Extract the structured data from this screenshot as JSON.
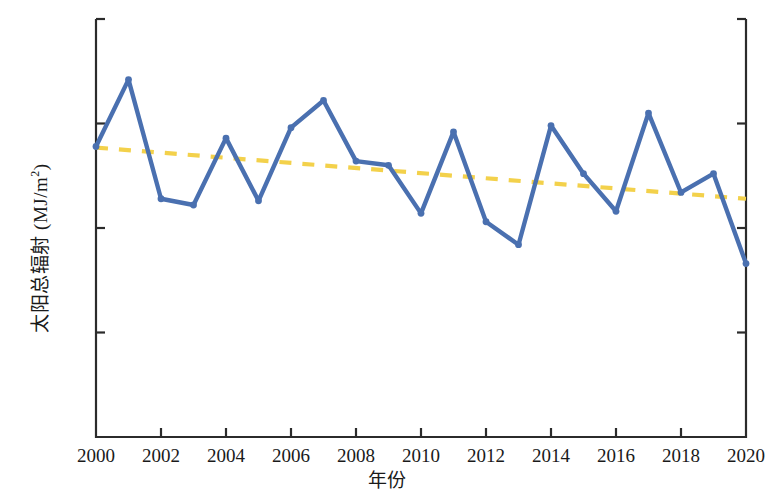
{
  "chart_data": {
    "type": "line",
    "title": "",
    "xlabel": "年份",
    "ylabel": "太阳总辐射 (MJ/m2)",
    "ylabel_main": "太阳总辐射 (MJ/m",
    "ylabel_sup": "2",
    "ylabel_tail": ")",
    "xlim": [
      2000,
      2020
    ],
    "ylim": [
      13.0,
      15.0
    ],
    "grid": false,
    "legend": "none",
    "ytick_labels": [
      "15.00",
      "14.50",
      "14.00",
      "13.50",
      "13.00"
    ],
    "ytick_values": [
      15.0,
      14.5,
      14.0,
      13.5,
      13.0
    ],
    "ytick_step": 0.5,
    "xtick_labels": [
      "2000",
      "2002",
      "2004",
      "2006",
      "2008",
      "2010",
      "2012",
      "2014",
      "2016",
      "2018",
      "2020"
    ],
    "xtick_values": [
      2000,
      2002,
      2004,
      2006,
      2008,
      2010,
      2012,
      2014,
      2016,
      2018,
      2020
    ],
    "xtick_step": 2,
    "x": [
      2000,
      2001,
      2002,
      2003,
      2004,
      2005,
      2006,
      2007,
      2008,
      2009,
      2010,
      2011,
      2012,
      2013,
      2014,
      2015,
      2016,
      2017,
      2018,
      2019,
      2020
    ],
    "series": [
      {
        "name": "太阳总辐射",
        "type": "line",
        "color": "#4A70B0",
        "marker": "circle",
        "values": [
          14.39,
          14.71,
          14.14,
          14.11,
          14.43,
          14.13,
          14.48,
          14.61,
          14.32,
          14.3,
          14.07,
          14.46,
          14.03,
          13.92,
          14.49,
          14.26,
          14.08,
          14.55,
          14.17,
          14.26,
          13.83
        ]
      },
      {
        "name": "线性趋势线",
        "type": "trendline",
        "style": "dashed",
        "color": "#F3D14B",
        "x_endpoints": [
          2000,
          2020
        ],
        "y_endpoints": [
          14.385,
          14.14
        ]
      }
    ]
  },
  "colors": {
    "line": "#4A70B0",
    "trend": "#F3D14B",
    "axis": "#2b2b2b",
    "text": "#1a1a1a",
    "background": "#ffffff"
  }
}
